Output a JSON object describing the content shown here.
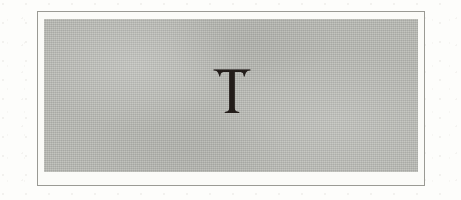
{
  "page": {
    "background_color": "#fdfdfb",
    "width": 461,
    "height": 200
  },
  "plate": {
    "frame_color": "#9a9a94",
    "frame_fill_color": "#fbfbf8",
    "panel_color": "#b8b9b3",
    "texture": "halftone-screen"
  },
  "dropcap": {
    "character": "T",
    "style": "serif-capital",
    "color": "#231d1a",
    "alt_text": "T"
  }
}
